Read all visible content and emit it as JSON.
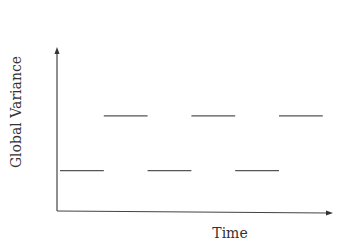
{
  "chart_data": {
    "type": "line",
    "title": "",
    "xlabel": "Time",
    "ylabel": "Global Variance",
    "xlim": [
      0,
      6.3
    ],
    "ylim": [
      0,
      1
    ],
    "grid": false,
    "legend": "none",
    "axis_ticks": false,
    "series": [
      {
        "name": "global-variance-steps",
        "segments": [
          {
            "x0": 0,
            "x1": 1,
            "y": 0.28
          },
          {
            "x0": 1,
            "x1": 2,
            "y": 0.66
          },
          {
            "x0": 2,
            "x1": 3,
            "y": 0.28
          },
          {
            "x0": 3,
            "x1": 4,
            "y": 0.66
          },
          {
            "x0": 4,
            "x1": 5,
            "y": 0.28
          },
          {
            "x0": 5,
            "x1": 6,
            "y": 0.66
          }
        ]
      }
    ]
  }
}
